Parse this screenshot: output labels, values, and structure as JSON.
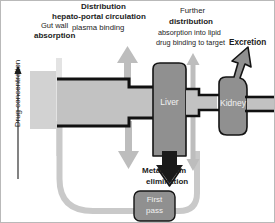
{
  "diagram": {
    "title_alt": "Drug absorption, distribution, metabolism and excretion schematic",
    "axis": {
      "label": "Drug concentration",
      "direction": "up"
    },
    "labels": {
      "gut_wall_line1": "Gut wall",
      "gut_wall_line2": "absorption",
      "distribution_line1": "Distribution",
      "distribution_line2": "hepato-portal circulation",
      "distribution_line3": "plasma binding",
      "further_line1": "Further",
      "further_line2": "distribution",
      "further_line3": "absorption into lipid",
      "further_line4": "drug binding to target",
      "excretion": "Excretion",
      "metabolism_line1": "Metabolism",
      "metabolism_line2": "elimination"
    },
    "organs": {
      "liver": "Liver",
      "kidney": "Kidney",
      "first_pass_line1": "First",
      "first_pass_line2": "pass"
    },
    "colors": {
      "background": "#ffffff",
      "border": "#b9b9b9",
      "gut_block": "#d2d2d2",
      "gut_wall_bar": "#e2e2e2",
      "pipe_fill": "#c2c2c2",
      "pipe_outline": "#111111",
      "organ_fill": "#909090",
      "organ_outline": "#141414",
      "arrow_gray": "#bdbdbd",
      "tube_gray": "#c6c6c6",
      "text": "#1c1c1c",
      "organ_text": "#f2f2f2"
    }
  }
}
